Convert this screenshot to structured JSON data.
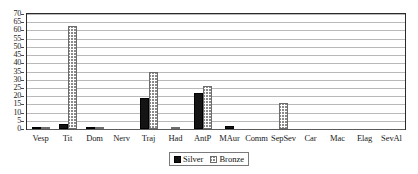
{
  "chart_data": {
    "type": "bar",
    "title": "",
    "subtitle": "",
    "xlabel": "",
    "ylabel": "",
    "ylim": [
      0,
      70
    ],
    "ytick_step": 5,
    "yticks": [
      0,
      5,
      10,
      15,
      20,
      25,
      30,
      35,
      40,
      45,
      50,
      55,
      60,
      65,
      70
    ],
    "grid": true,
    "legend_position": "bottom-center",
    "categories": [
      "Vesp",
      "Tit",
      "Dom",
      "Nerv",
      "Traj",
      "Had",
      "AntP",
      "MAur",
      "Comm",
      "SepSev",
      "Car",
      "Mac",
      "Elag",
      "SevAl"
    ],
    "series": [
      {
        "name": "Silver",
        "color": "#141414",
        "pattern": "solid",
        "values": [
          1,
          3,
          1,
          0,
          19,
          0,
          22,
          2,
          0,
          0,
          0,
          0,
          0,
          0
        ]
      },
      {
        "name": "Bronze",
        "color": "#8a8a8a",
        "pattern": "cross-hatch",
        "values": [
          1,
          63,
          1,
          0,
          35,
          1,
          26,
          0,
          0,
          16,
          0,
          0,
          0,
          0
        ]
      }
    ]
  },
  "legend": {
    "items": [
      {
        "label": "Silver",
        "swatch": "solid-black-swatch"
      },
      {
        "label": "Bronze",
        "swatch": "hatched-swatch"
      }
    ]
  }
}
